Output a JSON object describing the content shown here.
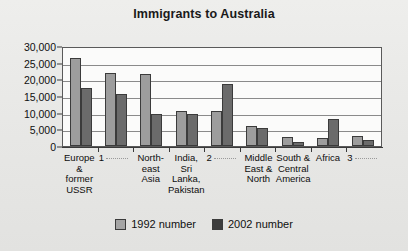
{
  "chart_data": {
    "type": "bar",
    "title": "Immigrants to Australia",
    "xlabel": "",
    "ylabel": "",
    "ylim": [
      0,
      30000
    ],
    "ytick_labels": [
      "30,000",
      "25,000",
      "20,000",
      "15,000",
      "10,000",
      "5,000",
      "0"
    ],
    "ytick_values": [
      30000,
      25000,
      20000,
      15000,
      10000,
      5000,
      0
    ],
    "grid": true,
    "legend_position": "bottom",
    "categories": [
      "Europe & former USSR",
      "1 .....",
      "North-east Asia",
      "India, Sri Lanka, Pakistan",
      "2 .....",
      "Middle East & North",
      "South & Central America",
      "Africa",
      "3 ....."
    ],
    "category_lines": [
      [
        "Europe",
        "& former",
        "USSR"
      ],
      [
        "1"
      ],
      [
        "North-",
        "east",
        "Asia"
      ],
      [
        "India,",
        "Sri",
        "Lanka,",
        "Pakistan"
      ],
      [
        "2"
      ],
      [
        "Middle",
        "East &",
        "North"
      ],
      [
        "South &",
        "Central",
        "America"
      ],
      [
        "Africa"
      ],
      [
        "3"
      ]
    ],
    "series": [
      {
        "name": "1992 number",
        "color": "#9d9d9d",
        "values": [
          26500,
          22000,
          21500,
          10500,
          10500,
          6000,
          2800,
          2500,
          3000
        ]
      },
      {
        "name": "2002 number",
        "color": "#6b6b6b",
        "values": [
          17500,
          15500,
          9500,
          9500,
          18500,
          5500,
          1200,
          8000,
          1800
        ]
      }
    ]
  },
  "legend": {
    "items": [
      {
        "label": "1992 number",
        "color": "#a5a5a5"
      },
      {
        "label": "2002 number",
        "color": "#3c3c3c"
      }
    ]
  }
}
